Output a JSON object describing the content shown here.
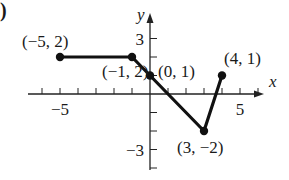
{
  "panel_label": ")",
  "chart_data": {
    "type": "line",
    "title": "",
    "xlabel": "x",
    "ylabel": "y",
    "xlim": [
      -6,
      6
    ],
    "ylim": [
      -4,
      4
    ],
    "grid": false,
    "x_tick_labels": [
      {
        "value": -5,
        "label": "−5"
      },
      {
        "value": 5,
        "label": "5"
      }
    ],
    "y_tick_labels": [
      {
        "value": 3,
        "label": "3"
      },
      {
        "value": -3,
        "label": "−3"
      }
    ],
    "series": [
      {
        "name": "piecewise",
        "points": [
          {
            "x": -5,
            "y": 2,
            "label": "(−5, 2)"
          },
          {
            "x": -1,
            "y": 2,
            "label": "(−1, 2)"
          },
          {
            "x": 0,
            "y": 1,
            "label": "(0, 1)"
          },
          {
            "x": 3,
            "y": -2,
            "label": "(3, −2)"
          },
          {
            "x": 4,
            "y": 1,
            "label": "(4, 1)"
          }
        ]
      }
    ]
  }
}
